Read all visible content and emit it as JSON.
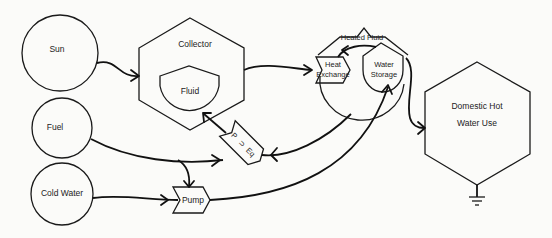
{
  "diagram": {
    "type": "flow-diagram",
    "nodes": [
      {
        "id": "sun",
        "label": "Sun",
        "shape": "circle"
      },
      {
        "id": "fuel",
        "label": "Fuel",
        "shape": "circle"
      },
      {
        "id": "cold_water",
        "label": "Cold Water",
        "shape": "circle"
      },
      {
        "id": "collector",
        "label": "Collector",
        "shape": "hexagon"
      },
      {
        "id": "fluid",
        "label": "Fluid",
        "shape": "tank"
      },
      {
        "id": "p_eq",
        "label_line1": "P",
        "label_line2": "⊃",
        "label_line3": "Eq",
        "shape": "interaction"
      },
      {
        "id": "pump",
        "label": "Pump",
        "shape": "interaction"
      },
      {
        "id": "heated_fluid",
        "label": "Heated Fluid",
        "shape": "hexagon-container"
      },
      {
        "id": "heat_exchange",
        "label_line1": "Heat",
        "label_line2": "Exchange",
        "shape": "interaction"
      },
      {
        "id": "water_storage",
        "label_line1": "Water",
        "label_line2": "Storage",
        "shape": "tank"
      },
      {
        "id": "domestic_hot_water",
        "label_line1": "Domestic Hot",
        "label_line2": "Water Use",
        "shape": "hexagon"
      },
      {
        "id": "heat_sink",
        "label": "",
        "shape": "ground"
      }
    ],
    "edges": [
      {
        "from": "Sun",
        "to": "Collector"
      },
      {
        "from": "Collector",
        "to": "Heat Exchange"
      },
      {
        "from": "Heat Exchange",
        "to": "P ⊃ Eq"
      },
      {
        "from": "P ⊃ Eq",
        "to": "Fluid"
      },
      {
        "from": "Fuel",
        "to": "P ⊃ Eq"
      },
      {
        "from": "Fuel",
        "to": "Pump"
      },
      {
        "from": "Cold Water",
        "to": "Pump"
      },
      {
        "from": "Pump",
        "to": "Water Storage"
      },
      {
        "from": "Water Storage",
        "to": "Heat Exchange"
      },
      {
        "from": "Water Storage",
        "to": "Domestic Hot Water Use"
      },
      {
        "from": "Domestic Hot Water Use",
        "to": "Heat Sink"
      }
    ]
  }
}
